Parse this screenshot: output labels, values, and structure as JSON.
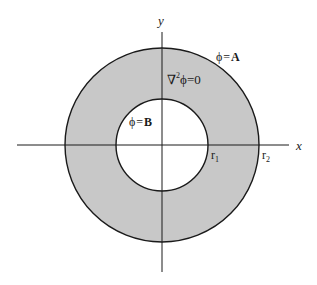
{
  "diagram": {
    "type": "annular-region-laplace",
    "axes": {
      "x_label": "x",
      "y_label": "y"
    },
    "labels": {
      "outer_boundary_phi": "ϕ",
      "outer_boundary_eq": "=",
      "outer_boundary_value": "A",
      "laplace_nabla": "∇",
      "laplace_sup": "2",
      "laplace_rest": "ϕ=0",
      "inner_boundary_phi": "ϕ",
      "inner_boundary_eq": "=",
      "inner_boundary_value": "B",
      "r1_base": "r",
      "r1_sub": "1",
      "r2_base": "r",
      "r2_sub": "2"
    },
    "colors": {
      "annulus_fill": "#c8c8c8",
      "stroke": "#1a1a1a",
      "background": "#ffffff"
    }
  }
}
